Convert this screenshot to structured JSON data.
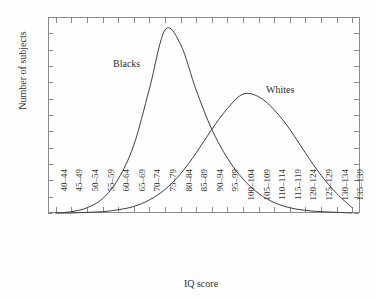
{
  "chart_data": {
    "type": "line",
    "title": "",
    "xlabel": "IQ score",
    "ylabel": "Number of subjects",
    "grid": false,
    "legend_position": "inline-annotation",
    "ylim": [
      0,
      300
    ],
    "yticks": [
      0,
      25,
      50,
      75,
      100,
      125,
      150,
      175,
      200,
      225,
      250,
      275,
      300
    ],
    "ytick_labels": [
      "0",
      "25",
      "50",
      "75",
      "100",
      "125",
      "150",
      "175",
      "200",
      "225",
      "250",
      "275",
      "300"
    ],
    "categories": [
      "40–44",
      "45–49",
      "50–54",
      "55–59",
      "60–64",
      "65–69",
      "70–74",
      "75–79",
      "80–84",
      "85–89",
      "90–94",
      "95–99",
      "100–104",
      "105–109",
      "110–114",
      "115–119",
      "120–124",
      "125–129",
      "130–134",
      "135–139"
    ],
    "series": [
      {
        "name": "Blacks",
        "label": "Blacks",
        "peak_value": 280,
        "peak_category": "75–79",
        "values": [
          0,
          2,
          8,
          22,
          52,
          104,
          190,
          280,
          258,
          188,
          128,
          84,
          52,
          30,
          16,
          8,
          4,
          2,
          1,
          0
        ]
      },
      {
        "name": "Whites",
        "label": "Whites",
        "peak_value": 182,
        "peak_category": "100–104",
        "values": [
          0,
          0,
          1,
          2,
          5,
          10,
          20,
          36,
          60,
          92,
          128,
          160,
          182,
          178,
          158,
          128,
          92,
          58,
          30,
          8
        ]
      }
    ]
  }
}
